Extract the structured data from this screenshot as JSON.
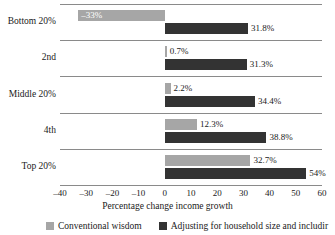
{
  "chart_data": {
    "type": "bar",
    "orientation": "horizontal",
    "title": "",
    "xlabel": "Percentage change income growth",
    "ylabel": "",
    "xlim": [
      -40,
      60
    ],
    "xticks": [
      -40,
      -30,
      -20,
      -10,
      0,
      10,
      20,
      30,
      40,
      50,
      60
    ],
    "xticklabels": [
      "–40",
      "–30",
      "–20",
      "–10",
      "0",
      "10",
      "20",
      "30",
      "40",
      "50",
      "60"
    ],
    "grid": false,
    "legend_position": "bottom",
    "categories": [
      "Bottom 20%",
      "2nd",
      "Middle 20%",
      "4th",
      "Top 20%"
    ],
    "series": [
      {
        "name": "Conventional wisdom",
        "color": "#a6a6a6",
        "values": [
          -33,
          0.7,
          2.2,
          12.3,
          32.7
        ],
        "labels": [
          "–33%",
          "0.7%",
          "2.2%",
          "12.3%",
          "32.7%"
        ]
      },
      {
        "name": "Adjusting for household size and includir",
        "color": "#333333",
        "values": [
          31.8,
          31.3,
          34.4,
          38.8,
          54
        ],
        "labels": [
          "31.8%",
          "31.3%",
          "34.4%",
          "38.8%",
          "54%"
        ]
      }
    ]
  },
  "legend": {
    "items": [
      {
        "label": "Conventional wisdom",
        "color": "#a6a6a6"
      },
      {
        "label": "Adjusting for household size and includir",
        "color": "#333333"
      }
    ]
  }
}
